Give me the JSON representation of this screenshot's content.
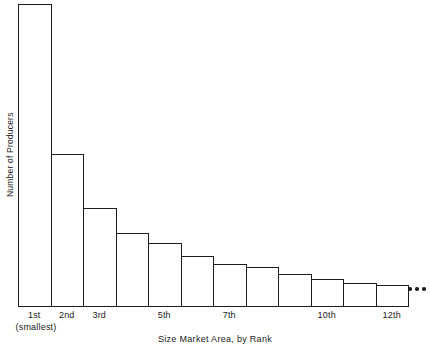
{
  "chart_data": {
    "type": "bar",
    "title": "",
    "subtitle": "",
    "xlabel": "Size Market Area, by Rank",
    "ylabel": "Number of Producers",
    "grid": false,
    "legend": null,
    "axis_style": "bars-only, no axis spines, no y tick labels",
    "categories": [
      "1st",
      "2nd",
      "3rd",
      "4th",
      "5th",
      "6th",
      "7th",
      "8th",
      "9th",
      "10th",
      "11th",
      "12th"
    ],
    "values": [
      100,
      50.5,
      32.8,
      24.5,
      21.2,
      17.0,
      14.3,
      13.3,
      11.0,
      9.3,
      8.0,
      7.3
    ],
    "value_units": "relative (unlabeled axis)",
    "ylim": [
      0,
      100
    ],
    "visible_tick_labels": [
      "1st",
      "2nd",
      "3rd",
      "5th",
      "7th",
      "10th",
      "12th"
    ],
    "tick_label_categories": [
      1,
      2,
      3,
      5,
      7,
      10,
      12
    ],
    "annotations": [
      {
        "name": "smallest-note",
        "text": "(smallest)",
        "attached_to": "1st"
      },
      {
        "name": "continuation-ellipsis",
        "text": "• • •",
        "position": "right of 12th bar"
      }
    ]
  },
  "axes": {
    "y_title": "Number of Producers",
    "x_title": "Size Market Area, by Rank",
    "x_ticks": [
      {
        "label": "1st",
        "index": 0
      },
      {
        "label": "2nd",
        "index": 1
      },
      {
        "label": "3rd",
        "index": 2
      },
      {
        "label": "5th",
        "index": 4
      },
      {
        "label": "7th",
        "index": 6
      },
      {
        "label": "10th",
        "index": 9
      },
      {
        "label": "12th",
        "index": 11
      }
    ],
    "x_sub_note": "(smallest)"
  },
  "ellipsis": {
    "dot_count": 3
  },
  "colors": {
    "ink": "#1d1d1d",
    "background": "#ffffff",
    "bar_fill": "transparent"
  }
}
